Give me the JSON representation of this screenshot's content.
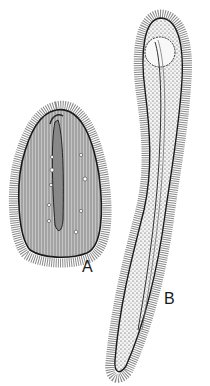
{
  "figure": {
    "type": "biological-illustration",
    "labels": {
      "a": "A",
      "b": "B"
    },
    "colors": {
      "ink": "#1a1a1a",
      "background": "#ffffff",
      "cilia": "#6a6a6a",
      "body_fill_a": "#b8b8b8",
      "body_fill_b": "#f2f2f2"
    }
  }
}
